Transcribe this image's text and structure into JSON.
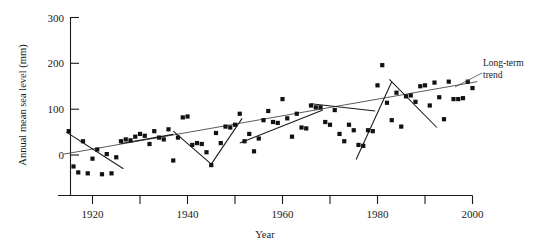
{
  "chart_data": {
    "type": "scatter",
    "title": "",
    "xlabel": "Year",
    "ylabel": "Annual mean sea level (mm)",
    "xlim": [
      1913,
      2002
    ],
    "ylim": [
      -60,
      310
    ],
    "grid": false,
    "legend": "none",
    "xticks": [
      1920,
      1930,
      1940,
      1950,
      1960,
      1970,
      1980,
      1990,
      2000
    ],
    "xtick_labels": [
      "1920",
      "",
      "1940",
      "",
      "1960",
      "",
      "1980",
      "",
      "2000"
    ],
    "yticks": [
      0,
      100,
      200,
      300
    ],
    "ytick_labels": [
      "0",
      "100",
      "200",
      "300"
    ],
    "marker": "square",
    "marker_color": "#111111",
    "points": [
      {
        "x": 1915,
        "y": 52
      },
      {
        "x": 1916,
        "y": -25
      },
      {
        "x": 1917,
        "y": -38
      },
      {
        "x": 1918,
        "y": 30
      },
      {
        "x": 1919,
        "y": -40
      },
      {
        "x": 1920,
        "y": -8
      },
      {
        "x": 1921,
        "y": 12
      },
      {
        "x": 1922,
        "y": -42
      },
      {
        "x": 1923,
        "y": 2
      },
      {
        "x": 1924,
        "y": -40
      },
      {
        "x": 1925,
        "y": -5
      },
      {
        "x": 1926,
        "y": 30
      },
      {
        "x": 1927,
        "y": 34
      },
      {
        "x": 1928,
        "y": 32
      },
      {
        "x": 1929,
        "y": 40
      },
      {
        "x": 1930,
        "y": 46
      },
      {
        "x": 1931,
        "y": 42
      },
      {
        "x": 1932,
        "y": 24
      },
      {
        "x": 1933,
        "y": 52
      },
      {
        "x": 1934,
        "y": 38
      },
      {
        "x": 1935,
        "y": 34
      },
      {
        "x": 1936,
        "y": 56
      },
      {
        "x": 1937,
        "y": -12
      },
      {
        "x": 1938,
        "y": 38
      },
      {
        "x": 1939,
        "y": 82
      },
      {
        "x": 1940,
        "y": 84
      },
      {
        "x": 1941,
        "y": 22
      },
      {
        "x": 1942,
        "y": 26
      },
      {
        "x": 1943,
        "y": 24
      },
      {
        "x": 1944,
        "y": 6
      },
      {
        "x": 1945,
        "y": -22
      },
      {
        "x": 1946,
        "y": 48
      },
      {
        "x": 1947,
        "y": 26
      },
      {
        "x": 1948,
        "y": 62
      },
      {
        "x": 1949,
        "y": 60
      },
      {
        "x": 1950,
        "y": 66
      },
      {
        "x": 1951,
        "y": 90
      },
      {
        "x": 1952,
        "y": 30
      },
      {
        "x": 1953,
        "y": 46
      },
      {
        "x": 1954,
        "y": 8
      },
      {
        "x": 1955,
        "y": 36
      },
      {
        "x": 1956,
        "y": 76
      },
      {
        "x": 1957,
        "y": 96
      },
      {
        "x": 1958,
        "y": 72
      },
      {
        "x": 1959,
        "y": 70
      },
      {
        "x": 1960,
        "y": 122
      },
      {
        "x": 1961,
        "y": 80
      },
      {
        "x": 1962,
        "y": 40
      },
      {
        "x": 1963,
        "y": 90
      },
      {
        "x": 1964,
        "y": 60
      },
      {
        "x": 1965,
        "y": 58
      },
      {
        "x": 1966,
        "y": 108
      },
      {
        "x": 1967,
        "y": 104
      },
      {
        "x": 1968,
        "y": 104
      },
      {
        "x": 1969,
        "y": 72
      },
      {
        "x": 1970,
        "y": 66
      },
      {
        "x": 1971,
        "y": 98
      },
      {
        "x": 1972,
        "y": 46
      },
      {
        "x": 1973,
        "y": 30
      },
      {
        "x": 1974,
        "y": 66
      },
      {
        "x": 1975,
        "y": 54
      },
      {
        "x": 1976,
        "y": 22
      },
      {
        "x": 1977,
        "y": 20
      },
      {
        "x": 1978,
        "y": 54
      },
      {
        "x": 1979,
        "y": 52
      },
      {
        "x": 1980,
        "y": 152
      },
      {
        "x": 1981,
        "y": 196
      },
      {
        "x": 1982,
        "y": 114
      },
      {
        "x": 1983,
        "y": 76
      },
      {
        "x": 1984,
        "y": 136
      },
      {
        "x": 1985,
        "y": 62
      },
      {
        "x": 1986,
        "y": 128
      },
      {
        "x": 1987,
        "y": 130
      },
      {
        "x": 1988,
        "y": 116
      },
      {
        "x": 1989,
        "y": 150
      },
      {
        "x": 1990,
        "y": 152
      },
      {
        "x": 1991,
        "y": 108
      },
      {
        "x": 1992,
        "y": 158
      },
      {
        "x": 1993,
        "y": 126
      },
      {
        "x": 1994,
        "y": 78
      },
      {
        "x": 1995,
        "y": 160
      },
      {
        "x": 1996,
        "y": 122
      },
      {
        "x": 1997,
        "y": 122
      },
      {
        "x": 1998,
        "y": 124
      },
      {
        "x": 1999,
        "y": 160
      },
      {
        "x": 2000,
        "y": 146
      }
    ],
    "long_term_trend": {
      "x": [
        1914,
        2001
      ],
      "y": [
        2,
        160
      ]
    },
    "segment_trends": [
      {
        "name": "segment-1915-1926",
        "x": [
          1914.5,
          1926.5
        ],
        "y": [
          50,
          -30
        ]
      },
      {
        "name": "segment-1926-1936",
        "x": [
          1926.0,
          1937.0
        ],
        "y": [
          25,
          45
        ]
      },
      {
        "name": "segment-1937-1945",
        "x": [
          1937.0,
          1945.0
        ],
        "y": [
          52,
          -20
        ]
      },
      {
        "name": "segment-1945-1951",
        "x": [
          1945.0,
          1951.5
        ],
        "y": [
          -20,
          80
        ]
      },
      {
        "name": "segment-1951-1968",
        "x": [
          1951.0,
          1968.5
        ],
        "y": [
          26,
          98
        ]
      },
      {
        "name": "segment-1966-1979",
        "x": [
          1966.0,
          1979.5
        ],
        "y": [
          112,
          96
        ]
      },
      {
        "name": "segment-1975-1983",
        "x": [
          1975.5,
          1983.0
        ],
        "y": [
          -10,
          160
        ]
      },
      {
        "name": "segment-1983-1993",
        "x": [
          1982.5,
          1992.5
        ],
        "y": [
          165,
          60
        ]
      }
    ],
    "annotations": [
      {
        "name": "long-term-trend-label",
        "text_line1": "Long-term",
        "text_line2": "trend"
      }
    ]
  }
}
